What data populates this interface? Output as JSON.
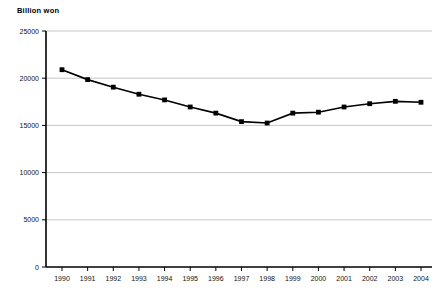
{
  "chart_data": {
    "type": "line",
    "title": "",
    "ylabel": "Billion won",
    "xlabel": "",
    "categories": [
      "1990",
      "1991",
      "1992",
      "1993",
      "1994",
      "1995",
      "1996",
      "1997",
      "1998",
      "1999",
      "2000",
      "2001",
      "2002",
      "2003",
      "2004"
    ],
    "values": [
      20900,
      19850,
      19050,
      18300,
      17700,
      16950,
      16300,
      15400,
      15250,
      16300,
      16400,
      16950,
      17300,
      17550,
      17450
    ],
    "series": [
      {
        "name": "Billion won",
        "values": [
          20900,
          19850,
          19050,
          18300,
          17700,
          16950,
          16300,
          15400,
          15250,
          16300,
          16400,
          16950,
          17300,
          17550,
          17450
        ]
      }
    ],
    "ylim": [
      0,
      25000
    ],
    "yticks": [
      0,
      5000,
      10000,
      15000,
      20000,
      25000
    ],
    "ytick_labels": [
      "0",
      "5000",
      "10000",
      "15000",
      "20000",
      "25000"
    ],
    "xtick_labels": [
      "1990",
      "1991",
      "1992",
      "1993",
      "1994",
      "1995",
      "1996",
      "1997",
      "1998",
      "1999",
      "2000",
      "2001",
      "2002",
      "2003",
      "2004"
    ],
    "grid": true,
    "legend": false,
    "legend_position": "none",
    "marker": "square",
    "line_color": "#000000",
    "grid_color": "#b9b9b9",
    "axis_color": "#000000",
    "background_color": "#ffffff"
  }
}
